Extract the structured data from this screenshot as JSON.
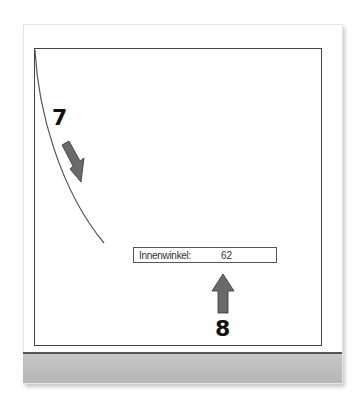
{
  "annotations": {
    "step_7": "7",
    "step_8": "8"
  },
  "field": {
    "label": "Innenwinkel:",
    "value": "62"
  },
  "colors": {
    "frame_border": "#444444",
    "arrow_fill": "#6a6a6a",
    "statusbar": "#bdbdbd"
  }
}
